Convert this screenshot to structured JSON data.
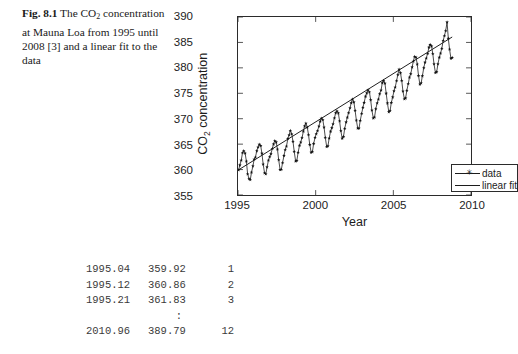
{
  "caption": {
    "figure_label": "Fig. 8.1",
    "text_part1": "The CO",
    "subscript": "2",
    "text_part2": " concentration at Mauna Loa from 1995 until 2008 [3] and a linear fit to the data"
  },
  "figure": {
    "ylabel_prefix": "CO",
    "ylabel_subscript": "2",
    "ylabel_suffix": " concentration",
    "xlabel": "Year",
    "legend": {
      "data_label": "data",
      "fit_label": "linear fit",
      "marker_glyph": "✳"
    }
  },
  "listing": {
    "rows": [
      {
        "year": "1995.04",
        "value": "359.92",
        "index": "1"
      },
      {
        "year": "1995.12",
        "value": "360.86",
        "index": "2"
      },
      {
        "year": "1995.21",
        "value": "361.83",
        "index": "3"
      }
    ],
    "ellipsis": ":",
    "last_row": {
      "year": "2010.96",
      "value": "389.79",
      "index": "12"
    }
  },
  "chart_data": {
    "type": "line",
    "title": "",
    "xlabel": "Year",
    "ylabel": "CO2 concentration",
    "xlim": [
      1995,
      2010
    ],
    "ylim": [
      355,
      390
    ],
    "xticks": [
      1995,
      2000,
      2005,
      2010
    ],
    "yticks": [
      355,
      360,
      365,
      370,
      375,
      380,
      385,
      390
    ],
    "grid": false,
    "legend_position": "lower right",
    "line_color": "#1c1c1c",
    "marker": "star",
    "series": [
      {
        "name": "data",
        "x": [
          1995.04,
          1995.12,
          1995.21,
          1995.29,
          1995.37,
          1995.46,
          1995.54,
          1995.62,
          1995.71,
          1995.79,
          1995.87,
          1995.96,
          1996.04,
          1996.12,
          1996.21,
          1996.29,
          1996.37,
          1996.46,
          1996.54,
          1996.62,
          1996.71,
          1996.79,
          1996.87,
          1996.96,
          1997.04,
          1997.12,
          1997.21,
          1997.29,
          1997.37,
          1997.46,
          1997.54,
          1997.62,
          1997.71,
          1997.79,
          1997.87,
          1997.96,
          1998.04,
          1998.12,
          1998.21,
          1998.29,
          1998.37,
          1998.46,
          1998.54,
          1998.62,
          1998.71,
          1998.79,
          1998.87,
          1998.96,
          1999.04,
          1999.12,
          1999.21,
          1999.29,
          1999.37,
          1999.46,
          1999.54,
          1999.62,
          1999.71,
          1999.79,
          1999.87,
          1999.96,
          2000.04,
          2000.12,
          2000.21,
          2000.29,
          2000.37,
          2000.46,
          2000.54,
          2000.62,
          2000.71,
          2000.79,
          2000.87,
          2000.96,
          2001.04,
          2001.12,
          2001.21,
          2001.29,
          2001.37,
          2001.46,
          2001.54,
          2001.62,
          2001.71,
          2001.79,
          2001.87,
          2001.96,
          2002.04,
          2002.12,
          2002.21,
          2002.29,
          2002.37,
          2002.46,
          2002.54,
          2002.62,
          2002.71,
          2002.79,
          2002.87,
          2002.96,
          2003.04,
          2003.12,
          2003.21,
          2003.29,
          2003.37,
          2003.46,
          2003.54,
          2003.62,
          2003.71,
          2003.79,
          2003.87,
          2003.96,
          2004.04,
          2004.12,
          2004.21,
          2004.29,
          2004.37,
          2004.46,
          2004.54,
          2004.62,
          2004.71,
          2004.79,
          2004.87,
          2004.96,
          2005.04,
          2005.12,
          2005.21,
          2005.29,
          2005.37,
          2005.46,
          2005.54,
          2005.62,
          2005.71,
          2005.79,
          2005.87,
          2005.96,
          2006.04,
          2006.12,
          2006.21,
          2006.29,
          2006.37,
          2006.46,
          2006.54,
          2006.62,
          2006.71,
          2006.79,
          2006.87,
          2006.96,
          2007.04,
          2007.12,
          2007.21,
          2007.29,
          2007.37,
          2007.46,
          2007.54,
          2007.62,
          2007.71,
          2007.79,
          2007.87,
          2007.96,
          2008.04,
          2008.12,
          2008.21,
          2008.29,
          2008.37,
          2008.46,
          2008.54,
          2008.62,
          2008.71,
          2008.79
        ],
        "y": [
          359.92,
          360.86,
          361.83,
          363.3,
          363.69,
          363.19,
          361.64,
          359.12,
          358.17,
          357.99,
          359.45,
          360.68,
          362.02,
          362.41,
          363.675,
          364.39,
          364.94,
          364.69,
          363.17,
          361.05,
          359.32,
          359.11,
          360.48,
          361.82,
          362.5,
          363.07,
          364.13,
          364.99,
          365.66,
          365.39,
          364.0,
          361.91,
          359.98,
          360.0,
          361.33,
          362.73,
          363.9,
          364.57,
          366.07,
          366.78,
          367.66,
          366.99,
          365.52,
          363.54,
          361.64,
          361.78,
          363.36,
          364.74,
          365.36,
          366.24,
          367.51,
          368.53,
          369.1,
          368.31,
          366.83,
          364.9,
          363.37,
          363.48,
          365.09,
          366.29,
          367.02,
          367.61,
          368.51,
          369.47,
          370.06,
          369.8,
          368.3,
          366.29,
          364.49,
          364.62,
          366.16,
          367.5,
          368.18,
          368.96,
          370.14,
          371.13,
          371.52,
          371.1,
          369.54,
          367.61,
          366.12,
          366.47,
          368.06,
          369.32,
          370.26,
          371.15,
          372.1,
          373.1,
          373.83,
          373.25,
          371.6,
          369.68,
          368.1,
          368.11,
          369.64,
          371.01,
          372.19,
          373.16,
          374.38,
          375.02,
          375.62,
          375.25,
          373.7,
          371.65,
          370.11,
          370.27,
          371.93,
          373.07,
          373.83,
          374.88,
          375.6,
          377.04,
          377.47,
          376.95,
          374.97,
          373.06,
          371.33,
          371.56,
          373.15,
          374.24,
          375.44,
          376.18,
          377.46,
          378.63,
          379.7,
          379.0,
          377.49,
          375.4,
          373.87,
          374.04,
          375.55,
          376.86,
          378.13,
          378.8,
          380.14,
          381.3,
          382.23,
          382.07,
          380.71,
          378.46,
          376.75,
          377.0,
          378.41,
          380.0,
          381.07,
          381.89,
          382.82,
          384.02,
          384.56,
          384.26,
          382.77,
          380.74,
          379.03,
          379.2,
          380.74,
          382.05,
          382.86,
          383.8,
          385.37,
          386.3,
          387.29,
          388.98,
          385.78,
          383.65,
          381.85,
          382.0
        ]
      },
      {
        "name": "linear fit",
        "slope": 1.9,
        "intercept": -3432.8,
        "x": [
          1995.04,
          2008.79
        ],
        "y": [
          359.95,
          386.07
        ]
      }
    ]
  }
}
